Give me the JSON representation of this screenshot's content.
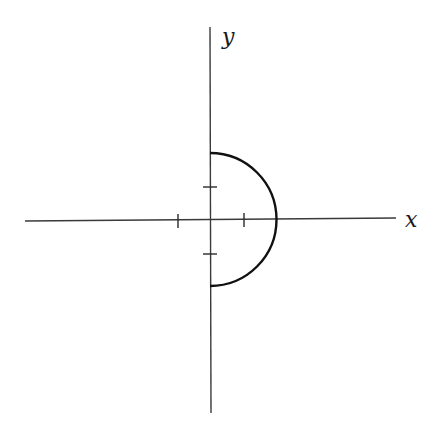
{
  "diagram": {
    "type": "coordinate-plot",
    "axes": {
      "x_label": "x",
      "y_label": "y"
    },
    "origin_px": [
      210,
      220
    ],
    "unit_px": 33,
    "ticks": {
      "x": [
        -1,
        1
      ],
      "y": [
        -1,
        1
      ]
    },
    "curve": {
      "shape": "semicircle",
      "center": [
        0,
        0
      ],
      "radius": 2,
      "side": "right",
      "endpoints": [
        [
          0,
          2
        ],
        [
          2,
          0
        ],
        [
          0,
          -2
        ]
      ]
    },
    "colors": {
      "axis": "#3a3a3a",
      "curve": "#111111",
      "background": "#ffffff"
    }
  }
}
